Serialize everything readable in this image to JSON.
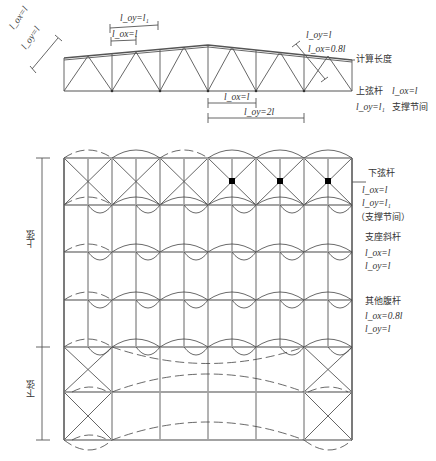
{
  "truss_elevation": {
    "labels": {
      "inclined_lox": "l_ox=l",
      "inclined_loy": "l_oy=l",
      "top_loy": "l_oy=l₁",
      "top_lox": "l_ox=l",
      "diag_loy": "l_oy=l",
      "diag_lox": "l_ox=0.8l",
      "calc_length": "计算长度",
      "top_chord_title": "上弦杆",
      "top_chord_lox": "l_ox=l",
      "top_chord_loy": "l_oy=l₁",
      "top_chord_note": "支撑节间",
      "bottom_lox": "l_ox=l",
      "bottom_loy": "l_oy=2l"
    }
  },
  "plan_view": {
    "left_dims": {
      "upper": "上弦",
      "lower": "下弦"
    },
    "legend": {
      "bottom_chord": {
        "title": "下弦杆",
        "lox": "l_ox=l",
        "loy": "l_oy=l₁",
        "note": "（支撑节间）"
      },
      "support_diagonal": {
        "title": "支座斜杆",
        "lox": "l_ox=l",
        "loy": "l_oy=l"
      },
      "other_web": {
        "title": "其他腹杆",
        "lox": "l_ox=0.8l",
        "loy": "l_oy=l"
      }
    }
  },
  "colors": {
    "line": "#555555",
    "chord": "#666666",
    "text": "#333333",
    "node": "#000000"
  }
}
